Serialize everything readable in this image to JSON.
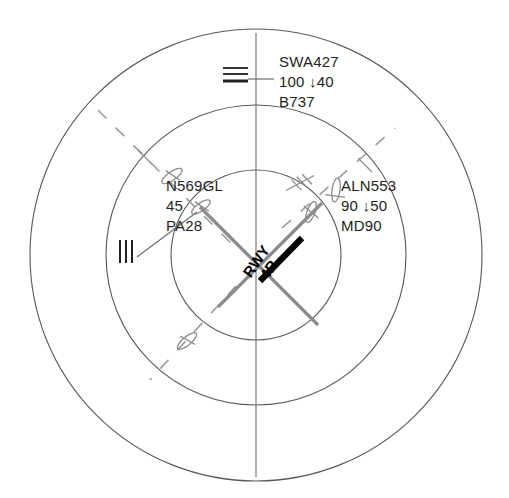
{
  "display": {
    "name": "terminal-radar-scope",
    "background_color": "#ffffff",
    "ring_color": "#58595b",
    "aircraft_color": "#8a8c8e",
    "runway_color": "#8a8c8e",
    "active_runway_color": "#000000",
    "text_color": "#231f20",
    "center": {
      "x": 256,
      "y": 255
    },
    "rings": [
      {
        "name": "outer-range-ring",
        "radius": 226
      },
      {
        "name": "middle-range-ring",
        "radius": 150
      },
      {
        "name": "inner-range-ring",
        "radius": 85
      }
    ],
    "vertical_axis": {
      "x": 256,
      "y1": 33,
      "y2": 477
    },
    "dashed_track": {
      "angle_deg": -45,
      "label": "approach-course-dashed"
    }
  },
  "runway": {
    "label_line1": "RWY",
    "label_line2": "4R",
    "rotation_deg": -55,
    "active_strip_color": "#000000",
    "inactive_strip_color": "#8a8c8e"
  },
  "targets": [
    {
      "id": "swa427",
      "callsign": "SWA427",
      "altitude": "100",
      "trend_arrow": "↓",
      "target_altitude": "40",
      "type": "B737",
      "symbol": "triple-bar-marker",
      "x": 234,
      "y": 73,
      "leader_to_x": 272,
      "leader_to_y": 73
    },
    {
      "id": "n569gl",
      "callsign": "N569GL",
      "altitude": "45",
      "trend_arrow": "",
      "target_altitude": "",
      "type": "PA28",
      "symbol": "triple-bar-vertical-marker",
      "x": 127,
      "y": 250,
      "leader_to_x": 180,
      "leader_to_y": 225
    },
    {
      "id": "aln553",
      "callsign": "ALN553",
      "altitude": "90",
      "trend_arrow": "↓",
      "target_altitude": "50",
      "type": "MD90",
      "symbol": "aircraft-glyph",
      "x": 336,
      "y": 190,
      "leader_to_x": 310,
      "leader_to_y": 188
    }
  ],
  "datablocks": [
    {
      "name": "datablock-swa427",
      "x": 279,
      "y": 52,
      "lines": [
        "SWA427",
        "100 ↓40",
        "B737"
      ]
    },
    {
      "name": "datablock-n569gl",
      "x": 166,
      "y": 176,
      "lines": [
        "N569GL",
        "45",
        "PA28"
      ]
    },
    {
      "name": "datablock-aln553",
      "x": 341,
      "y": 176,
      "lines": [
        "ALN553",
        "90 ↓50",
        "MD90"
      ]
    }
  ],
  "aircraft_symbols": [
    {
      "name": "aircraft-symbol-nw-outer",
      "x": 172,
      "y": 176,
      "rotation": -35
    },
    {
      "name": "aircraft-symbol-nw-inner",
      "x": 201,
      "y": 207,
      "rotation": -35
    },
    {
      "name": "aircraft-symbol-ne-inner",
      "x": 311,
      "y": 212,
      "rotation": 35
    },
    {
      "name": "aircraft-symbol-e-outer",
      "x": 336,
      "y": 190,
      "rotation": 10
    },
    {
      "name": "aircraft-symbol-sw-outer",
      "x": 187,
      "y": 341,
      "rotation": -40
    }
  ]
}
